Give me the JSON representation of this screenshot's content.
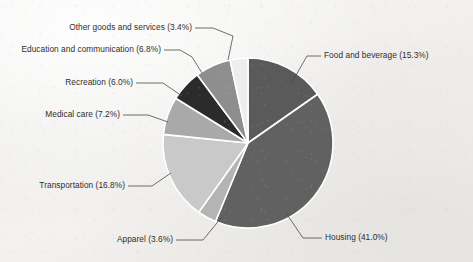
{
  "chart_data": {
    "type": "pie",
    "title": "",
    "subtitle": "",
    "xlabel": "",
    "ylabel": "",
    "legend_position": "none",
    "grid": false,
    "labels_format": "name (percent%)",
    "start_angle_deg": 0,
    "direction": "clockwise",
    "categories": [
      "Food and beverage",
      "Housing",
      "Apparel",
      "Transportation",
      "Medical care",
      "Recreation",
      "Education and communication",
      "Other goods and services"
    ],
    "values": [
      15.3,
      41.0,
      3.6,
      16.8,
      7.2,
      6.0,
      6.8,
      3.4
    ],
    "units": "percent",
    "slices": [
      {
        "label": "Food and beverage",
        "percent": 15.3,
        "text": "Food and beverage (15.3%)",
        "color": "#5a5a5a"
      },
      {
        "label": "Housing",
        "percent": 41.0,
        "text": "Housing (41.0%)",
        "color": "#616161"
      },
      {
        "label": "Apparel",
        "percent": 3.6,
        "text": "Apparel (3.6%)",
        "color": "#b4b4b4"
      },
      {
        "label": "Transportation",
        "percent": 16.8,
        "text": "Transportation (16.8%)",
        "color": "#c9c9c9"
      },
      {
        "label": "Medical care",
        "percent": 7.2,
        "text": "Medical care (7.2%)",
        "color": "#a9a9a9"
      },
      {
        "label": "Recreation",
        "percent": 6.0,
        "text": "Recreation (6.0%)",
        "color": "#2b2b2b"
      },
      {
        "label": "Education and communication",
        "percent": 6.8,
        "text": "Education and communication (6.8%)",
        "color": "#8e8e8e"
      },
      {
        "label": "Other goods and services",
        "percent": 3.4,
        "text": "Other goods and services (3.4%)",
        "color": "#eeeeee"
      }
    ]
  },
  "figure": {
    "background_color": "#f1f0ee",
    "separator_color": "#ffffff",
    "leader_line_color": "#4a4a4a",
    "text_color": "#2e2e2e"
  }
}
